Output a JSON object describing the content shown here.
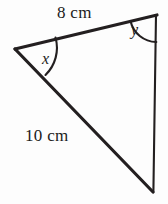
{
  "figure": {
    "kind": "triangle-with-labeled-angles",
    "background_color": "#fdfdfd",
    "stroke_color": "#231f20",
    "arc_color": "#231f20",
    "width": 168,
    "height": 204,
    "vertices": {
      "left": {
        "name": "left-vertex",
        "x": 15,
        "y": 49
      },
      "top_right": {
        "name": "top-right-vertex",
        "x": 157,
        "y": 15
      },
      "bottom_right": {
        "name": "bottom-right-vertex",
        "x": 153,
        "y": 192
      }
    },
    "sides": [
      {
        "name": "top-side",
        "from": "left",
        "to": "top_right",
        "label": "8 cm",
        "thickness": 3
      },
      {
        "name": "hypotenuse-side",
        "from": "left",
        "to": "bottom_right",
        "label": "10 cm",
        "thickness": 3
      },
      {
        "name": "right-vertical-side",
        "from": "top_right",
        "to": "bottom_right",
        "label": "",
        "thickness": 2
      }
    ],
    "angles": [
      {
        "name": "angle-x",
        "label": "x",
        "at_vertex": "left",
        "arc_radius": 38
      },
      {
        "name": "angle-y",
        "label": "y",
        "at_vertex": "top_right",
        "arc_radius": 27
      }
    ]
  },
  "labels": {
    "side_top": "8 cm",
    "side_left": "10 cm",
    "angle_x": "x",
    "angle_y": "y"
  }
}
